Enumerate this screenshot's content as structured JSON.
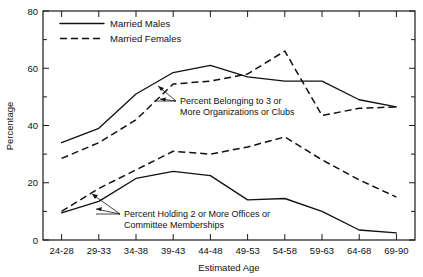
{
  "chart_data": {
    "type": "line",
    "title": "",
    "xlabel": "Estimated Age",
    "ylabel": "Percentage",
    "categories": [
      "24-28",
      "29-33",
      "34-38",
      "39-43",
      "44-48",
      "49-53",
      "54-58",
      "59-63",
      "64-68",
      "69-90"
    ],
    "ylim": [
      0,
      80
    ],
    "y_ticks_major": [
      0,
      20,
      40,
      60,
      80
    ],
    "y_ticks_minor": [
      10,
      30,
      50,
      70
    ],
    "grid": false,
    "legend_position": "top-left",
    "series": [
      {
        "name": "Married Males",
        "style": "solid",
        "group": "Percent Belonging to 3 or More Organizations or Clubs",
        "values": [
          34,
          39,
          51,
          58.5,
          61,
          57,
          55.5,
          55.5,
          49,
          46.5
        ]
      },
      {
        "name": "Married Females",
        "style": "dashed",
        "group": "Percent Belonging to 3 or More Organizations or Clubs",
        "values": [
          28.5,
          34,
          42,
          54.5,
          55.5,
          58,
          66,
          43.5,
          46,
          46.5
        ]
      },
      {
        "name": "Married Males",
        "style": "solid",
        "group": "Percent Holding 2 or More Offices or Committee Memberships",
        "values": [
          9.5,
          13.5,
          21.5,
          24,
          22.5,
          14,
          14.5,
          10,
          3.5,
          2.5
        ]
      },
      {
        "name": "Married Females",
        "style": "dashed",
        "group": "Percent Holding 2 or More Offices or Committee Memberships",
        "values": [
          10,
          18,
          24.5,
          31,
          30,
          32.5,
          36,
          28,
          21,
          15
        ]
      }
    ],
    "legend": [
      {
        "label": "Married Males",
        "style": "solid"
      },
      {
        "label": "Married Females",
        "style": "dashed"
      }
    ],
    "annotations": [
      {
        "line1": "Percent Belonging to 3 or",
        "line2": "More Organizations or Clubs"
      },
      {
        "line1": "Percent Holding 2 or More Offices or",
        "line2": "Committee Memberships"
      }
    ],
    "axis_tick_labels": {
      "y": [
        "0",
        "20",
        "40",
        "60",
        "80"
      ],
      "x": [
        "24-28",
        "29-33",
        "34-38",
        "39-43",
        "44-48",
        "49-53",
        "54-58",
        "59-63",
        "64-68",
        "69-90"
      ]
    }
  }
}
